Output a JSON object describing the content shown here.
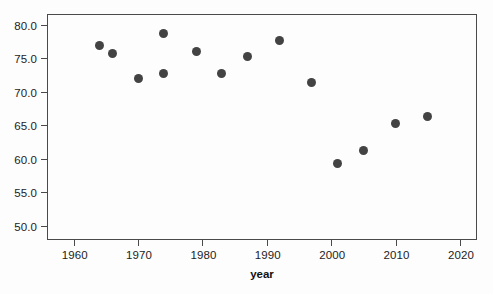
{
  "chart_data": {
    "type": "scatter",
    "title": "",
    "xlabel": "year",
    "ylabel": "",
    "xlim": [
      1956,
      2022.5
    ],
    "ylim": [
      48.0,
      81.5
    ],
    "xticks": [
      1960,
      1970,
      1980,
      1990,
      2000,
      2010,
      2020
    ],
    "xtick_labels": [
      "1960",
      "1970",
      "1980",
      "1990",
      "2000",
      "2010",
      "2020"
    ],
    "yticks": [
      50.0,
      55.0,
      60.0,
      65.0,
      70.0,
      75.0,
      80.0
    ],
    "ytick_labels": [
      "50.0",
      "55.0",
      "60.0",
      "65.0",
      "70.0",
      "75.0",
      "80.0"
    ],
    "grid": false,
    "legend": null,
    "marker_color": "#434343",
    "marker_shape": "circle",
    "x": [
      1964,
      1966,
      1970,
      1974,
      1974,
      1979,
      1983,
      1987,
      1992,
      1997,
      2001,
      2005,
      2010,
      2015
    ],
    "y": [
      77.0,
      75.8,
      72.0,
      78.8,
      72.8,
      76.0,
      72.8,
      75.3,
      77.7,
      71.4,
      59.3,
      61.3,
      65.2,
      66.3
    ],
    "points": [
      {
        "year": 1964,
        "value": 77.0
      },
      {
        "year": 1966,
        "value": 75.8
      },
      {
        "year": 1970,
        "value": 72.0
      },
      {
        "year": 1974,
        "value": 78.8
      },
      {
        "year": 1974,
        "value": 72.8
      },
      {
        "year": 1979,
        "value": 76.0
      },
      {
        "year": 1983,
        "value": 72.8
      },
      {
        "year": 1987,
        "value": 75.3
      },
      {
        "year": 1992,
        "value": 77.7
      },
      {
        "year": 1997,
        "value": 71.4
      },
      {
        "year": 2001,
        "value": 59.3
      },
      {
        "year": 2005,
        "value": 61.3
      },
      {
        "year": 2010,
        "value": 65.2
      },
      {
        "year": 2015,
        "value": 66.3
      }
    ]
  },
  "axis_titles": {
    "x": "year"
  },
  "caption": ""
}
